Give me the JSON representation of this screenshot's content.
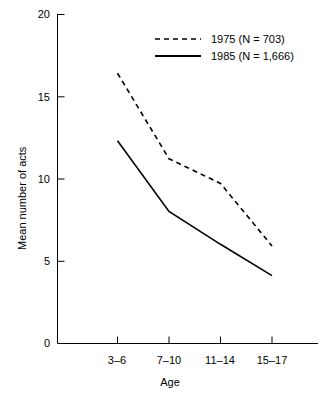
{
  "chart_data": {
    "type": "line",
    "title": "",
    "xlabel": "Age",
    "ylabel": "Mean number of acts",
    "categories": [
      "3–6",
      "7–10",
      "11–14",
      "15–17"
    ],
    "ylim": [
      0,
      20
    ],
    "yticks": [
      0,
      5,
      10,
      15,
      20
    ],
    "ytick_labels": [
      "0",
      "5",
      "10",
      "15",
      "20"
    ],
    "grid": false,
    "legend_position": "top-right",
    "series": [
      {
        "name": "1975 (N = 703)",
        "year": "1975",
        "n": "703",
        "style": "dashed",
        "color": "#000000",
        "values": [
          16.4,
          11.2,
          9.7,
          5.9
        ]
      },
      {
        "name": "1985 (N = 1,666)",
        "year": "1985",
        "n": "1,666",
        "style": "solid",
        "color": "#000000",
        "values": [
          12.3,
          8.0,
          6.0,
          4.1
        ]
      }
    ]
  },
  "axes": {
    "y_tick_0": "0",
    "y_tick_1": "5",
    "y_tick_2": "10",
    "y_tick_3": "15",
    "y_tick_4": "20",
    "x_tick_0": "3–6",
    "x_tick_1": "7–10",
    "x_tick_2": "11–14",
    "x_tick_3": "15–17",
    "x_title": "Age",
    "y_title": "Mean number of acts"
  },
  "legend": {
    "entry_0_label": "1975 (N = 703)",
    "entry_1_label": "1985 (N = 1,666)"
  }
}
